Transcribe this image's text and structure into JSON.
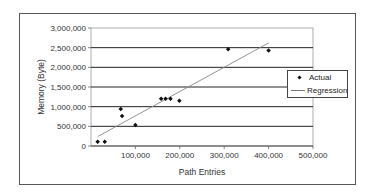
{
  "chart_data": {
    "type": "scatter",
    "title": "",
    "xlabel": "Path Entries",
    "ylabel": "Memory (Byte)",
    "xlim": [
      0,
      500000
    ],
    "ylim": [
      0,
      3000000
    ],
    "x_ticks": [
      "100,000",
      "200,000",
      "300,000",
      "400,000",
      "500,000"
    ],
    "y_ticks": [
      "0",
      "500,000",
      "1,000,000",
      "1,500,000",
      "2,000,000",
      "2,500,000",
      "3,000,000"
    ],
    "grid": "horizontal major gridlines",
    "legend_position": "right",
    "series": [
      {
        "name": "Actual",
        "kind": "scatter",
        "points": [
          {
            "x": 15000,
            "y": 110000
          },
          {
            "x": 31000,
            "y": 110000
          },
          {
            "x": 67000,
            "y": 940000
          },
          {
            "x": 70000,
            "y": 760000
          },
          {
            "x": 100000,
            "y": 535000
          },
          {
            "x": 158000,
            "y": 1200000
          },
          {
            "x": 168000,
            "y": 1200000
          },
          {
            "x": 179000,
            "y": 1200000
          },
          {
            "x": 199000,
            "y": 1150000
          },
          {
            "x": 309000,
            "y": 2460000
          },
          {
            "x": 400000,
            "y": 2430000
          }
        ]
      },
      {
        "name": "Regression",
        "kind": "line",
        "points": [
          {
            "x": 15000,
            "y": 240000
          },
          {
            "x": 400000,
            "y": 2620000
          }
        ]
      }
    ]
  },
  "legend": {
    "items": [
      {
        "label": "Actual",
        "marker": "diamond-dot"
      },
      {
        "label": "Regression",
        "marker": "line"
      }
    ]
  },
  "colors": {
    "points": "#111111",
    "regression": "#888888",
    "gridlines": "#222222",
    "frame": "#555555"
  }
}
